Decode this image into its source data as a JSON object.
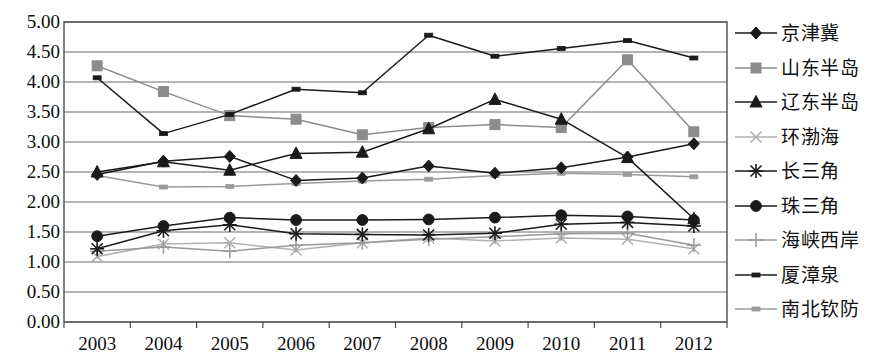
{
  "chart_data": {
    "type": "line",
    "title": "",
    "xlabel": "",
    "ylabel": "",
    "categories": [
      "2003",
      "2004",
      "2005",
      "2006",
      "2007",
      "2008",
      "2009",
      "2010",
      "2011",
      "2012"
    ],
    "ylim": [
      0.0,
      5.0
    ],
    "ytick_labels": [
      "0.00",
      "0.50",
      "1.00",
      "1.50",
      "2.00",
      "2.50",
      "3.00",
      "3.50",
      "4.00",
      "4.50",
      "5.00"
    ],
    "ytick_values": [
      0.0,
      0.5,
      1.0,
      1.5,
      2.0,
      2.5,
      3.0,
      3.5,
      4.0,
      4.5,
      5.0
    ],
    "grid": true,
    "legend_position": "right",
    "series": [
      {
        "name": "京津冀",
        "marker": "diamond",
        "color": "#1a1a1a",
        "values": [
          2.46,
          2.68,
          2.76,
          2.36,
          2.4,
          2.6,
          2.48,
          2.57,
          2.75,
          2.97
        ]
      },
      {
        "name": "山东半岛",
        "marker": "square",
        "color": "#8c8c8c",
        "values": [
          4.27,
          3.84,
          3.44,
          3.38,
          3.12,
          3.24,
          3.29,
          3.24,
          4.37,
          3.17
        ]
      },
      {
        "name": "辽东半岛",
        "marker": "triangle",
        "color": "#1a1a1a",
        "values": [
          2.5,
          2.67,
          2.53,
          2.81,
          2.83,
          3.22,
          3.71,
          3.38,
          2.74,
          1.72
        ]
      },
      {
        "name": "环渤海",
        "marker": "x",
        "color": "#b0b0b0",
        "values": [
          1.09,
          1.3,
          1.32,
          1.2,
          1.32,
          1.4,
          1.35,
          1.4,
          1.38,
          1.22
        ]
      },
      {
        "name": "长三角",
        "marker": "star",
        "color": "#1a1a1a",
        "values": [
          1.22,
          1.52,
          1.62,
          1.47,
          1.46,
          1.45,
          1.48,
          1.63,
          1.66,
          1.6
        ]
      },
      {
        "name": "珠三角",
        "marker": "circle",
        "color": "#1a1a1a",
        "values": [
          1.43,
          1.6,
          1.74,
          1.7,
          1.7,
          1.71,
          1.74,
          1.78,
          1.76,
          1.7
        ]
      },
      {
        "name": "海峡西岸",
        "marker": "plus",
        "color": "#9a9a9a",
        "values": [
          1.18,
          1.25,
          1.18,
          1.28,
          1.32,
          1.38,
          1.42,
          1.47,
          1.48,
          1.28
        ]
      },
      {
        "name": "厦漳泉",
        "marker": "dash",
        "color": "#1a1a1a",
        "values": [
          4.07,
          3.14,
          3.46,
          3.88,
          3.82,
          4.78,
          4.43,
          4.56,
          4.69,
          4.4
        ]
      },
      {
        "name": "南北钦防",
        "marker": "dash",
        "color": "#9a9a9a",
        "values": [
          2.44,
          2.25,
          2.26,
          2.31,
          2.35,
          2.38,
          2.44,
          2.48,
          2.46,
          2.42
        ]
      }
    ]
  },
  "legend": {
    "items": [
      {
        "label": "京津冀"
      },
      {
        "label": "山东半岛"
      },
      {
        "label": "辽东半岛"
      },
      {
        "label": "环渤海"
      },
      {
        "label": "长三角"
      },
      {
        "label": "珠三角"
      },
      {
        "label": "海峡西岸"
      },
      {
        "label": "厦漳泉"
      },
      {
        "label": "南北钦防"
      }
    ]
  },
  "axes": {
    "x_labels": [
      "2003",
      "2004",
      "2005",
      "2006",
      "2007",
      "2008",
      "2009",
      "2010",
      "2011",
      "2012"
    ],
    "y_labels": [
      "5.00",
      "4.50",
      "4.00",
      "3.50",
      "3.00",
      "2.50",
      "2.00",
      "1.50",
      "1.00",
      "0.50",
      "0.00"
    ]
  },
  "colors": {
    "plot_frame": "#4d4d4d",
    "gridline": "#6b6b6b",
    "background": "#ffffff",
    "text": "#111111"
  }
}
